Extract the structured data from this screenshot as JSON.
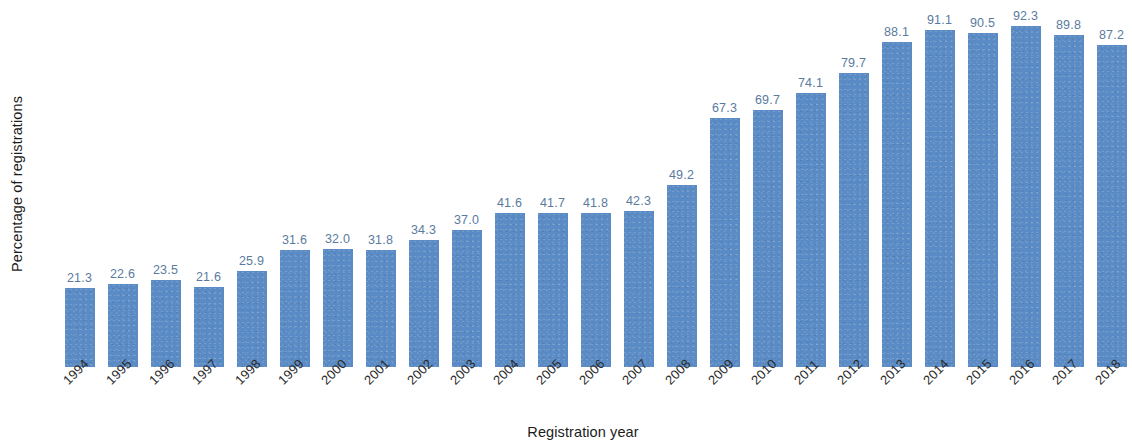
{
  "chart_data": {
    "type": "bar",
    "title": "",
    "subtitle": "",
    "xlabel": "Registration year",
    "ylabel": "Percentage of registrations",
    "categories": [
      "1994",
      "1995",
      "1996",
      "1997",
      "1998",
      "1999",
      "2000",
      "2001",
      "2002",
      "2003",
      "2004",
      "2005",
      "2006",
      "2007",
      "2008",
      "2009",
      "2010",
      "2011",
      "2012",
      "2013",
      "2014",
      "2015",
      "2016",
      "2017",
      "2018"
    ],
    "values": [
      21.3,
      22.6,
      23.5,
      21.6,
      25.9,
      31.6,
      32.0,
      31.8,
      34.3,
      37.0,
      41.6,
      41.7,
      41.8,
      42.3,
      49.2,
      67.3,
      69.7,
      74.1,
      79.7,
      88.1,
      91.1,
      90.5,
      92.3,
      89.8,
      87.2
    ],
    "data_labels": [
      "21.3",
      "22.6",
      "23.5",
      "21.6",
      "25.9",
      "31.6",
      "32.0",
      "31.8",
      "34.3",
      "37.0",
      "41.6",
      "41.7",
      "41.8",
      "42.3",
      "49.2",
      "67.3",
      "69.7",
      "74.1",
      "79.7",
      "88.1",
      "91.1",
      "90.5",
      "92.3",
      "89.8",
      "87.2"
    ],
    "ylim": [
      0,
      99
    ],
    "xlim_categories": 25,
    "grid": false,
    "y_axis_ticks_visible": false,
    "x_tick_label_rotation": -45,
    "legend": null,
    "legend_position": "none",
    "bar_color": "#5b8bc4",
    "data_label_color": "#5a7a9e",
    "axis_title_color": "#1c1c1c",
    "tick_label_color": "#2b2b2b",
    "background_color": "#ffffff"
  }
}
